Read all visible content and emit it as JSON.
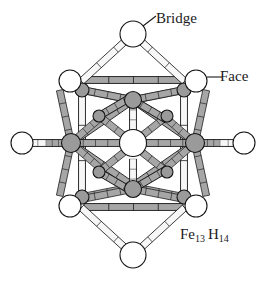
{
  "figure": {
    "formula": {
      "element1": "Fe",
      "count1": "13",
      "element2": "H",
      "count2": "14"
    },
    "annotations": [
      {
        "id": "bridge",
        "label": "Bridge",
        "leader": "diagonal",
        "target": "top-bridge-hydrogen"
      },
      {
        "id": "face",
        "label": "Face",
        "leader": "horizontal",
        "target": "upper-right-face-hydrogen"
      }
    ],
    "colors": {
      "background": "#ffffff",
      "outline": "#141414",
      "bond_fill": "#a6a6a6",
      "bond_highlight": "#f2f2f2",
      "iron_fill": "#9a9a9a",
      "hydrogen_fill": "#ffffff",
      "core_fill": "#ffffff",
      "label_text": "#1a1a1a"
    },
    "structure": {
      "type": "icosahedral-metal-cluster",
      "iron_atoms": 13,
      "hydrogen_atoms": 14,
      "iron_sites": [
        {
          "name": "center",
          "x": 133,
          "y": 143,
          "r": 13.5,
          "shade": "core"
        },
        {
          "name": "left",
          "x": 71,
          "y": 143,
          "r": 9.5,
          "shade": "iron"
        },
        {
          "name": "right",
          "x": 195,
          "y": 143,
          "r": 9.5,
          "shade": "iron"
        },
        {
          "name": "upper-mid",
          "x": 133,
          "y": 100,
          "r": 8.5,
          "shade": "iron"
        },
        {
          "name": "lower-mid",
          "x": 133,
          "y": 189,
          "r": 8.5,
          "shade": "iron"
        },
        {
          "name": "upper-left",
          "x": 82,
          "y": 90,
          "r": 7.0,
          "shade": "iron"
        },
        {
          "name": "upper-right",
          "x": 184,
          "y": 90,
          "r": 7.0,
          "shade": "iron"
        },
        {
          "name": "lower-left",
          "x": 82,
          "y": 197,
          "r": 7.0,
          "shade": "iron"
        },
        {
          "name": "lower-right",
          "x": 184,
          "y": 197,
          "r": 7.0,
          "shade": "iron"
        },
        {
          "name": "inner-upper-left",
          "x": 99,
          "y": 116,
          "r": 6.0,
          "shade": "iron"
        },
        {
          "name": "inner-upper-right",
          "x": 167,
          "y": 116,
          "r": 6.0,
          "shade": "iron"
        },
        {
          "name": "inner-lower-left",
          "x": 99,
          "y": 172,
          "r": 6.0,
          "shade": "iron"
        },
        {
          "name": "inner-lower-right",
          "x": 167,
          "y": 172,
          "r": 6.0,
          "shade": "iron"
        }
      ],
      "hydrogen_sites": [
        {
          "name": "bridge-top",
          "x": 133,
          "y": 34,
          "r": 13,
          "kind": "bridge"
        },
        {
          "name": "bridge-bottom",
          "x": 133,
          "y": 255,
          "r": 13,
          "kind": "bridge"
        },
        {
          "name": "face-upper-left",
          "x": 70,
          "y": 81,
          "r": 11,
          "kind": "face"
        },
        {
          "name": "face-upper-right",
          "x": 196,
          "y": 81,
          "r": 11,
          "kind": "face"
        },
        {
          "name": "face-lower-left",
          "x": 70,
          "y": 206,
          "r": 11,
          "kind": "face"
        },
        {
          "name": "face-lower-right",
          "x": 196,
          "y": 206,
          "r": 11,
          "kind": "face"
        },
        {
          "name": "terminal-left",
          "x": 22,
          "y": 143,
          "r": 11,
          "kind": "terminal"
        },
        {
          "name": "terminal-right",
          "x": 244,
          "y": 143,
          "r": 11,
          "kind": "terminal"
        }
      ]
    }
  }
}
